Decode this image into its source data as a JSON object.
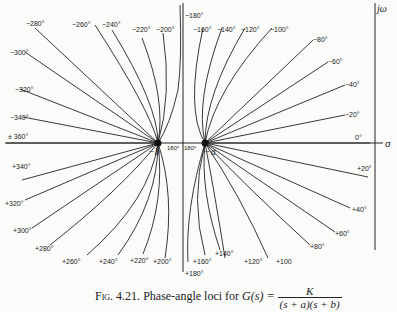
{
  "figure": {
    "axes": {
      "real_label": "σ",
      "imag_label": "jω"
    },
    "poles": [
      {
        "label": "−b"
      },
      {
        "label": "−a"
      }
    ],
    "center_labels": {
      "left": "180°",
      "right": "180°"
    },
    "upper_labels": {
      "m280": "−280°",
      "m260": "−260°",
      "m240": "−240°",
      "m220": "−220°",
      "m200": "−200°",
      "m180": "−180°",
      "m160": "−160°",
      "m140": "−140°",
      "m120": "−120°",
      "m100": "−100°",
      "m80": "−80°",
      "m60": "−60°",
      "m40": "−40°",
      "m20": "−20°",
      "z0": "0°",
      "m300": "−300°",
      "m320": "−320°",
      "m340": "−340°",
      "pm360": "± 360°"
    },
    "lower_labels": {
      "p340": "+340°",
      "p320": "+320°",
      "p300": "+300°",
      "p280": "+280°",
      "p260": "+260°",
      "p240": "+240°",
      "p220": "+220°",
      "p200": "+200°",
      "p180": "+180°",
      "p160": "+160°",
      "p140": "+140°",
      "p120": "+120°",
      "p100": "+100",
      "p80": "+80°",
      "p60": "+60°",
      "p40": "+40°",
      "p20": "+20°"
    },
    "caption": {
      "prefix": "Fig. 4.21.",
      "text": "Phase-angle loci for",
      "func": "G(s) =",
      "numerator": "K",
      "denominator": "(s + a)(s + b)"
    }
  }
}
